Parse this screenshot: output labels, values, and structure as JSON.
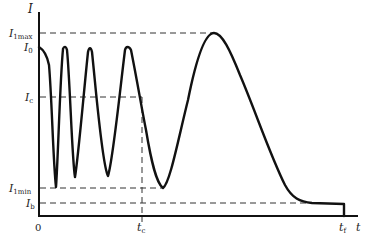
{
  "diagram": {
    "type": "current-time waveform",
    "axes": {
      "y_label": "I",
      "x_label": "t",
      "origin_label": "0"
    },
    "y_levels": [
      {
        "id": "I1max",
        "main": "I",
        "sub": "1max",
        "y": 33
      },
      {
        "id": "I0",
        "main": "I",
        "sub": "0",
        "y": 47
      },
      {
        "id": "Ic",
        "main": "I",
        "sub": "c",
        "y": 97
      },
      {
        "id": "I1min",
        "main": "I",
        "sub": "1min",
        "y": 188
      },
      {
        "id": "Ib",
        "main": "I",
        "sub": "b",
        "y": 203
      }
    ],
    "x_marks": [
      {
        "id": "tc",
        "main": "t",
        "sub": "c",
        "x": 142
      },
      {
        "id": "tf",
        "main": "t",
        "sub": "f",
        "x": 344
      }
    ],
    "colors": {
      "curve": "#111111",
      "axis": "#111111",
      "dashed": "#333333"
    }
  }
}
